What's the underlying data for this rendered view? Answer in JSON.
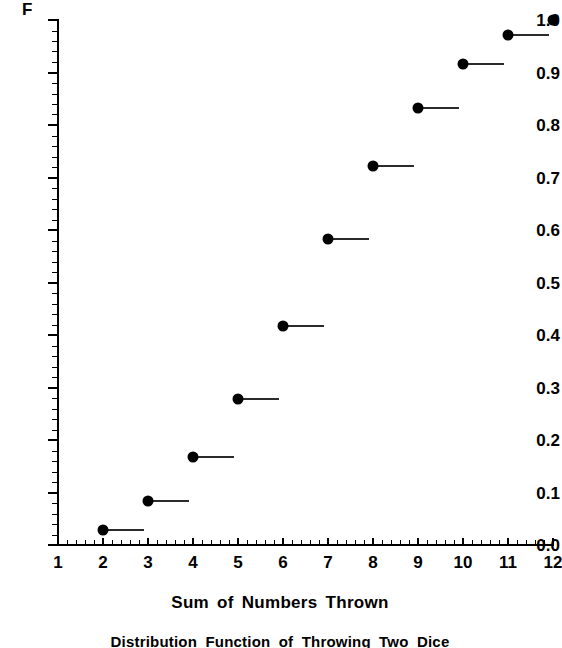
{
  "chart_data": {
    "type": "scatter",
    "title": "Distribution Function of Throwing Two Dice",
    "xlabel": "Sum of Numbers Thrown",
    "ylabel": "F",
    "xlim": [
      1,
      12
    ],
    "ylim": [
      0.0,
      1.0
    ],
    "grid": false,
    "legend": null,
    "style": "step-function (empirical cumulative distribution), filled dot at left end of each step with horizontal segment extending right",
    "x": [
      2,
      3,
      4,
      5,
      6,
      7,
      8,
      9,
      10,
      11,
      12
    ],
    "values": [
      0.028,
      0.083,
      0.167,
      0.278,
      0.417,
      0.583,
      0.722,
      0.833,
      0.917,
      0.972,
      1.0
    ],
    "value_fractions": [
      "1/36",
      "3/36",
      "6/36",
      "10/36",
      "15/36",
      "21/36",
      "26/36",
      "30/36",
      "33/36",
      "35/36",
      "36/36"
    ],
    "xticks": [
      1,
      2,
      3,
      4,
      5,
      6,
      7,
      8,
      9,
      10,
      11,
      12
    ],
    "xtick_labels": [
      "1",
      "2",
      "3",
      "4",
      "5",
      "6",
      "7",
      "8",
      "9",
      "10",
      "11",
      "12"
    ],
    "yticks": [
      0.0,
      0.1,
      0.2,
      0.3,
      0.4,
      0.5,
      0.6,
      0.7,
      0.8,
      0.9,
      1.0
    ],
    "ytick_labels": [
      "0.0",
      "0.1",
      "0.2",
      "0.3",
      "0.4",
      "0.5",
      "0.6",
      "0.7",
      "0.8",
      "0.9",
      "1.0"
    ],
    "x_minor_per_major": 5,
    "y_minor_per_major": 5,
    "marker_color": "#000000",
    "step_color": "#2b2b2b",
    "axis_color": "#000000",
    "background_color": "#ffffff",
    "last_point_has_trailing_segment": false
  },
  "labels": {
    "y_axis_title": "F",
    "x_axis_title": "Sum of Numbers Thrown",
    "caption": "Distribution Function of Throwing Two Dice"
  }
}
